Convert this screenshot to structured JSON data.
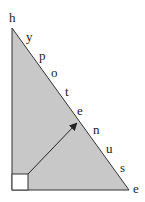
{
  "diagram": {
    "type": "right-triangle",
    "fill_color": "#c8c8c8",
    "stroke_color": "#333333",
    "right_angle_marker_fill": "#ffffff",
    "hypotenuse_letters": [
      {
        "char": "h",
        "x": 9,
        "y": 22
      },
      {
        "char": "y",
        "x": 26,
        "y": 41
      },
      {
        "char": "p",
        "x": 39,
        "y": 60
      },
      {
        "char": "o",
        "x": 51,
        "y": 77
      },
      {
        "char": "t",
        "x": 65,
        "y": 96
      },
      {
        "char": "e",
        "x": 77,
        "y": 115
      },
      {
        "char": "n",
        "x": 93,
        "y": 134
      },
      {
        "char": "u",
        "x": 106,
        "y": 153
      },
      {
        "char": "s",
        "x": 120,
        "y": 172
      },
      {
        "char": "e",
        "x": 133,
        "y": 193
      }
    ],
    "word": "hypotenuse"
  }
}
